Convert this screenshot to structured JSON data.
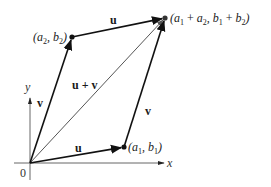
{
  "diagram": {
    "origin": {
      "label": "0",
      "x": 30,
      "y": 163
    },
    "axes": {
      "x": {
        "label": "x",
        "from": [
          14,
          163
        ],
        "to": [
          166,
          163
        ]
      },
      "y": {
        "label": "y",
        "from": [
          30,
          180
        ],
        "to": [
          30,
          98
        ]
      }
    },
    "points": {
      "p1": {
        "label_main": "(a",
        "sub1": "1",
        "mid": ", b",
        "sub2": "1",
        "end": ")",
        "x": 124,
        "y": 147
      },
      "p2": {
        "label_main": "(a",
        "sub1": "2",
        "mid": ", b",
        "sub2": "2",
        "end": ")",
        "x": 72,
        "y": 37
      },
      "sum": {
        "text": "(a1 + a2, b1 + b2)",
        "x": 165,
        "y": 18
      }
    },
    "vectors": [
      {
        "name": "u",
        "from": "origin",
        "to": "p1",
        "color": "#111111"
      },
      {
        "name": "v",
        "from": "origin",
        "to": "p2",
        "color": "#111111"
      },
      {
        "name": "u",
        "from": "p2",
        "to": "sum",
        "color": "#111111"
      },
      {
        "name": "v",
        "from": "p1",
        "to": "sum",
        "color": "#111111"
      },
      {
        "name": "u + v",
        "from": "origin",
        "to": "sum",
        "color": "#555555"
      }
    ],
    "labels": {
      "u_bottom": "u",
      "u_top": "u",
      "v_left": "v",
      "v_right": "v",
      "u_plus_v": "u + v",
      "x_axis": "x",
      "y_axis": "y",
      "origin": "0",
      "p1_a": "a",
      "p1_b": "b",
      "p1_sub": "1",
      "p2_a": "a",
      "p2_b": "b",
      "p2_sub": "2",
      "sum_a1": "a",
      "sum_a2": "a",
      "sum_b1": "b",
      "sum_b2": "b",
      "sub_1": "1",
      "sub_2": "2",
      "open_paren": "(",
      "close_paren": ")",
      "comma": ", ",
      "plus": " + "
    }
  }
}
